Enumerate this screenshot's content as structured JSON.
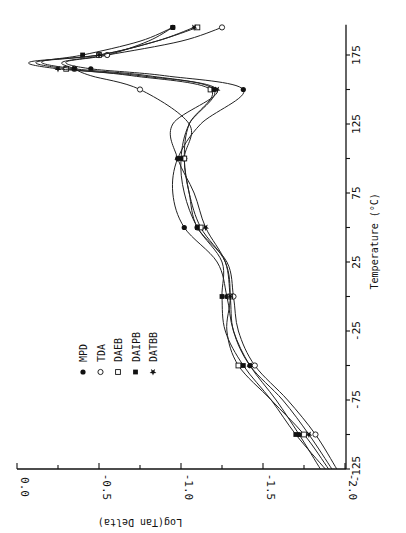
{
  "chart_data": {
    "type": "line",
    "title": "",
    "orientation": "rotated-90",
    "xlabel": "Temperature (°C)",
    "ylabel": "Log(Tan Delta)",
    "xlim": [
      -125,
      197
    ],
    "ylim": [
      -2.0,
      0.0
    ],
    "xticks": [
      -125,
      -75,
      -25,
      25,
      75,
      125,
      175
    ],
    "yticks": [
      0.0,
      -0.5,
      -1.0,
      -1.5,
      -2.0
    ],
    "ytick_labels": [
      "0.0",
      "-0.5",
      "-1.0",
      "-1.5",
      "-2.0"
    ],
    "xtick_labels": [
      "-125",
      "-75",
      "-25",
      "25",
      "75",
      "125",
      "175"
    ],
    "grid": false,
    "legend_position": "inside, lower-left region",
    "series": [
      {
        "name": "MPD",
        "marker": "filled-circle",
        "x": [
          -125,
          -100,
          -75,
          -50,
          -25,
          0,
          25,
          50,
          75,
          100,
          125,
          150,
          160,
          165,
          170,
          175,
          185,
          195
        ],
        "y": [
          -1.85,
          -1.72,
          -1.58,
          -1.42,
          -1.32,
          -1.28,
          -1.22,
          -1.02,
          -0.95,
          -0.98,
          -1.12,
          -1.38,
          -0.9,
          -0.45,
          -0.3,
          -0.55,
          -0.8,
          -0.95
        ]
      },
      {
        "name": "TDA",
        "marker": "open-circle",
        "x": [
          -125,
          -100,
          -75,
          -50,
          -25,
          0,
          25,
          50,
          75,
          100,
          125,
          150,
          160,
          165,
          170,
          175,
          185,
          195
        ],
        "y": [
          -1.95,
          -1.82,
          -1.65,
          -1.45,
          -1.35,
          -1.32,
          -1.28,
          -1.1,
          -1.05,
          -1.02,
          -1.05,
          -0.75,
          -0.45,
          -0.35,
          -0.28,
          -0.55,
          -1.0,
          -1.25
        ]
      },
      {
        "name": "DAEB",
        "marker": "open-square",
        "x": [
          -125,
          -100,
          -75,
          -50,
          -25,
          0,
          25,
          50,
          75,
          100,
          125,
          150,
          160,
          165,
          170,
          175,
          185,
          195
        ],
        "y": [
          -1.9,
          -1.75,
          -1.55,
          -1.35,
          -1.28,
          -1.3,
          -1.27,
          -1.12,
          -1.05,
          -1.02,
          -1.05,
          -1.18,
          -0.7,
          -0.3,
          -0.12,
          -0.5,
          -0.85,
          -1.1
        ]
      },
      {
        "name": "DAIPB",
        "marker": "filled-square",
        "x": [
          -125,
          -100,
          -75,
          -50,
          -25,
          0,
          25,
          50,
          75,
          100,
          125,
          150,
          160,
          165,
          170,
          175,
          185,
          195
        ],
        "y": [
          -1.88,
          -1.7,
          -1.55,
          -1.38,
          -1.27,
          -1.25,
          -1.25,
          -1.1,
          -1.02,
          -1.0,
          -1.05,
          -1.2,
          -0.8,
          -0.35,
          -0.15,
          -0.4,
          -0.75,
          -0.95
        ]
      },
      {
        "name": "DATBB",
        "marker": "filled-star",
        "x": [
          -125,
          -100,
          -75,
          -50,
          -25,
          0,
          25,
          50,
          75,
          100,
          125,
          150,
          160,
          165,
          170,
          175,
          185,
          195
        ],
        "y": [
          -1.92,
          -1.78,
          -1.62,
          -1.42,
          -1.32,
          -1.3,
          -1.27,
          -1.15,
          -1.08,
          -0.98,
          -0.95,
          -1.22,
          -0.75,
          -0.25,
          -0.08,
          -0.5,
          -0.85,
          -1.08
        ]
      }
    ]
  },
  "axes": {
    "log_axis_label": "Log(Tan Delta)",
    "temp_axis_label": "Temperature (°C)"
  },
  "legend": [
    {
      "label": "MPD",
      "marker": "filled-circle"
    },
    {
      "label": "TDA",
      "marker": "open-circle"
    },
    {
      "label": "DAEB",
      "marker": "open-square"
    },
    {
      "label": "DAIPB",
      "marker": "filled-square"
    },
    {
      "label": "DATBB",
      "marker": "filled-star"
    }
  ]
}
